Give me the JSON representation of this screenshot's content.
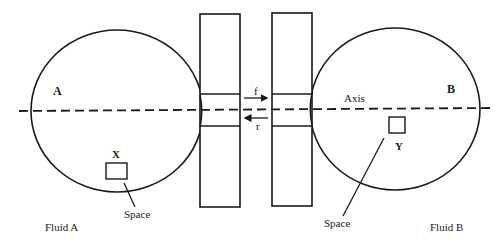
{
  "diagram": {
    "labels": {
      "body_a": "A",
      "body_b": "B",
      "axis": "Axis",
      "arrow_forward": "f",
      "arrow_reverse": "r",
      "box_x": "X",
      "box_y": "Y",
      "space_left": "Space",
      "space_right": "Space",
      "fluid_a": "Fluid A",
      "fluid_b": "Fluid B"
    },
    "colors": {
      "stroke": "#1a1a1a",
      "background": "#ffffff"
    }
  }
}
